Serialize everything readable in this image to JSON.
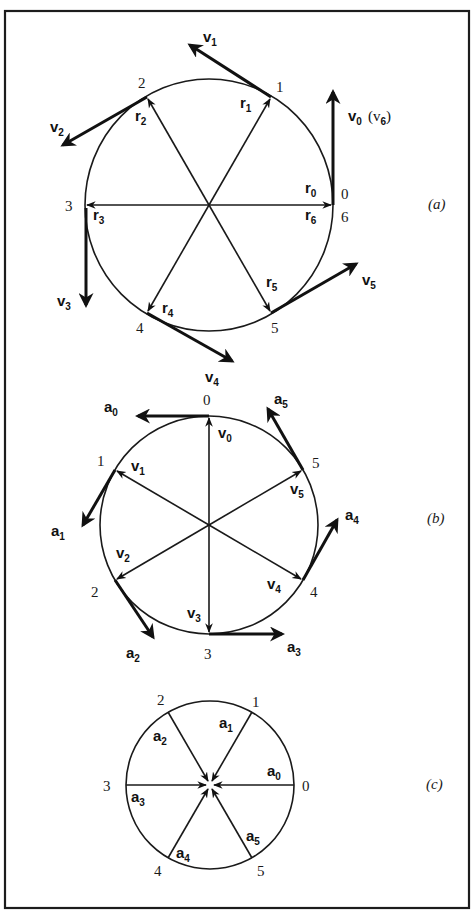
{
  "figure": {
    "panels": [
      {
        "id": "a",
        "label": "(a)",
        "point_labels": [
          "0",
          "1",
          "2",
          "3",
          "4",
          "5",
          "6"
        ],
        "radius_vectors": [
          {
            "sym": "r",
            "sub": "0"
          },
          {
            "sym": "r",
            "sub": "1"
          },
          {
            "sym": "r",
            "sub": "2"
          },
          {
            "sym": "r",
            "sub": "3"
          },
          {
            "sym": "r",
            "sub": "4"
          },
          {
            "sym": "r",
            "sub": "5"
          },
          {
            "sym": "r",
            "sub": "6"
          }
        ],
        "tangent_vectors": [
          {
            "sym": "v",
            "sub": "0",
            "extra": "(v",
            "extra_sub": "6",
            "extra_close": ")"
          },
          {
            "sym": "v",
            "sub": "1"
          },
          {
            "sym": "v",
            "sub": "2"
          },
          {
            "sym": "v",
            "sub": "3"
          },
          {
            "sym": "v",
            "sub": "4"
          },
          {
            "sym": "v",
            "sub": "5"
          }
        ]
      },
      {
        "id": "b",
        "label": "(b)",
        "point_labels": [
          "0",
          "1",
          "2",
          "3",
          "4",
          "5"
        ],
        "radius_vectors": [
          {
            "sym": "v",
            "sub": "0"
          },
          {
            "sym": "v",
            "sub": "1"
          },
          {
            "sym": "v",
            "sub": "2"
          },
          {
            "sym": "v",
            "sub": "3"
          },
          {
            "sym": "v",
            "sub": "4"
          },
          {
            "sym": "v",
            "sub": "5"
          }
        ],
        "tangent_vectors": [
          {
            "sym": "a",
            "sub": "0"
          },
          {
            "sym": "a",
            "sub": "1"
          },
          {
            "sym": "a",
            "sub": "2"
          },
          {
            "sym": "a",
            "sub": "3"
          },
          {
            "sym": "a",
            "sub": "4"
          },
          {
            "sym": "a",
            "sub": "5"
          }
        ]
      },
      {
        "id": "c",
        "label": "(c)",
        "point_labels": [
          "0",
          "1",
          "2",
          "3",
          "4",
          "5"
        ],
        "radius_vectors": [
          {
            "sym": "a",
            "sub": "0"
          },
          {
            "sym": "a",
            "sub": "1"
          },
          {
            "sym": "a",
            "sub": "2"
          },
          {
            "sym": "a",
            "sub": "3"
          },
          {
            "sym": "a",
            "sub": "4"
          },
          {
            "sym": "a",
            "sub": "5"
          }
        ]
      }
    ]
  }
}
